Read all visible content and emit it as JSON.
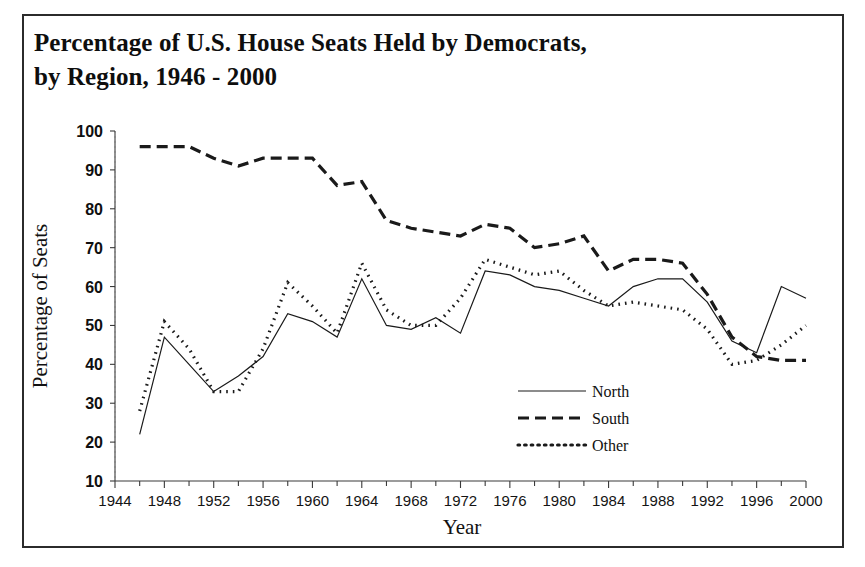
{
  "title": {
    "line1": "Percentage of U.S. House Seats Held by Democrats,",
    "line2": "by Region, 1946 - 2000"
  },
  "chart_data": {
    "type": "line",
    "title": "Percentage of U.S. House Seats Held by Democrats, by Region, 1946 - 2000",
    "xlabel": "Year",
    "ylabel": "Percentage of Seats",
    "xlim": [
      1944,
      2000
    ],
    "ylim": [
      10,
      100
    ],
    "grid": false,
    "legend_position": "inside-right",
    "x_ticks": [
      1944,
      1948,
      1952,
      1956,
      1960,
      1964,
      1968,
      1972,
      1976,
      1980,
      1984,
      1988,
      1992,
      1996,
      2000
    ],
    "x_minor_tick_step": 2,
    "y_ticks": [
      10,
      20,
      30,
      40,
      50,
      60,
      70,
      80,
      90,
      100
    ],
    "x": [
      1946,
      1948,
      1950,
      1952,
      1954,
      1956,
      1958,
      1960,
      1962,
      1964,
      1966,
      1968,
      1970,
      1972,
      1974,
      1976,
      1978,
      1980,
      1982,
      1984,
      1986,
      1988,
      1990,
      1992,
      1994,
      1996,
      1998,
      2000
    ],
    "series": [
      {
        "name": "North",
        "style": "solid",
        "values": [
          22,
          47,
          40,
          33,
          37,
          42,
          53,
          51,
          47,
          62,
          50,
          49,
          52,
          48,
          64,
          63,
          60,
          59,
          57,
          55,
          60,
          62,
          62,
          56,
          46,
          43,
          60,
          57
        ]
      },
      {
        "name": "South",
        "style": "dashed",
        "values": [
          96,
          96,
          96,
          93,
          91,
          93,
          93,
          93,
          86,
          87,
          77,
          75,
          74,
          73,
          76,
          75,
          70,
          71,
          73,
          64,
          67,
          67,
          66,
          58,
          47,
          42,
          41,
          41
        ]
      },
      {
        "name": "Other",
        "style": "dotted",
        "values": [
          28,
          51,
          44,
          33,
          33,
          44,
          61,
          55,
          48,
          66,
          54,
          50,
          50,
          57,
          67,
          65,
          63,
          64,
          59,
          55,
          56,
          55,
          54,
          49,
          40,
          41,
          45,
          50
        ]
      }
    ]
  },
  "legend": {
    "items": [
      {
        "label": "North",
        "style": "solid"
      },
      {
        "label": "South",
        "style": "dashed"
      },
      {
        "label": "Other",
        "style": "dotted"
      }
    ]
  },
  "colors": {
    "line": "#1a1a1a",
    "axis": "#3a3a3a",
    "text": "#111111",
    "frame": "#2b2b2b",
    "background": "#ffffff"
  }
}
